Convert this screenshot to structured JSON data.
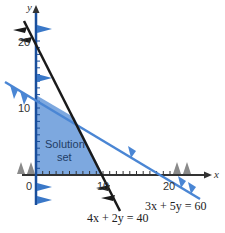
{
  "graph": {
    "x_axis_label": "x",
    "y_axis_label": "y",
    "origin_label": "0",
    "x_tick_labels": [
      "10",
      "20"
    ],
    "y_tick_labels": [
      "10",
      "20"
    ],
    "region_label_line1": "Solution",
    "region_label_line2": "set",
    "lines": [
      {
        "equation": "4x + 2y = 40",
        "color": "#1a1a1a",
        "x_intercept": 10,
        "y_intercept": 20
      },
      {
        "equation": "3x + 5y = 60",
        "color": "#4a86d4",
        "x_intercept": 20,
        "y_intercept": 12
      }
    ],
    "colors": {
      "axis_y": "#1a4f9c",
      "axis_x": "#333333",
      "region_fill": "#6f9fdc",
      "hatch_gray": "#8a8a8a"
    }
  }
}
